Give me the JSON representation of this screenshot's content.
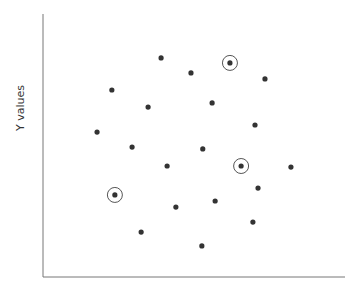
{
  "chart_data": {
    "type": "scatter",
    "title": "",
    "xlabel": "",
    "ylabel": "Y values",
    "grid": false,
    "legend": null,
    "xlim": [
      0,
      100
    ],
    "ylim": [
      0,
      100
    ],
    "x_ticks": [],
    "y_ticks": [],
    "point_color": "#333333",
    "highlight_color": "#555555",
    "points": [
      {
        "x": 39.1,
        "y": 83.3,
        "highlighted": false
      },
      {
        "x": 49.0,
        "y": 77.6,
        "highlighted": false
      },
      {
        "x": 61.9,
        "y": 81.4,
        "highlighted": true
      },
      {
        "x": 73.5,
        "y": 75.3,
        "highlighted": false
      },
      {
        "x": 22.8,
        "y": 71.1,
        "highlighted": false
      },
      {
        "x": 34.8,
        "y": 64.6,
        "highlighted": false
      },
      {
        "x": 56.0,
        "y": 66.2,
        "highlighted": false
      },
      {
        "x": 17.9,
        "y": 55.1,
        "highlighted": false
      },
      {
        "x": 70.2,
        "y": 57.8,
        "highlighted": false
      },
      {
        "x": 29.5,
        "y": 49.4,
        "highlighted": false
      },
      {
        "x": 52.9,
        "y": 48.7,
        "highlighted": false
      },
      {
        "x": 41.1,
        "y": 42.2,
        "highlighted": false
      },
      {
        "x": 65.6,
        "y": 42.2,
        "highlighted": true
      },
      {
        "x": 82.1,
        "y": 41.8,
        "highlighted": false
      },
      {
        "x": 23.8,
        "y": 31.2,
        "highlighted": true
      },
      {
        "x": 71.2,
        "y": 33.8,
        "highlighted": false
      },
      {
        "x": 57.0,
        "y": 28.9,
        "highlighted": false
      },
      {
        "x": 44.0,
        "y": 26.6,
        "highlighted": false
      },
      {
        "x": 69.5,
        "y": 20.9,
        "highlighted": false
      },
      {
        "x": 32.5,
        "y": 17.1,
        "highlighted": false
      },
      {
        "x": 52.6,
        "y": 11.8,
        "highlighted": false
      }
    ]
  },
  "layout": {
    "plot_left": 43,
    "plot_top": 14,
    "plot_right": 345,
    "plot_bottom": 277
  }
}
